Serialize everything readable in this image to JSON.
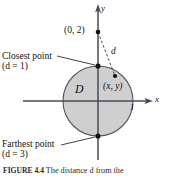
{
  "figure": {
    "caption_lead": "FIGURE 4.4",
    "caption_text": "The distance d from the",
    "background_color": "#ffffff"
  },
  "axes": {
    "x_label": "x",
    "y_label": "y",
    "axis_color": "#4a4a56",
    "origin_px": {
      "x": 98,
      "y": 101
    }
  },
  "disk": {
    "label": "D",
    "fill_color": "#cfcfcf",
    "stroke_color": "#555560",
    "center_px": {
      "x": 98,
      "y": 101
    },
    "radius_px": 35,
    "radius_label": "1"
  },
  "points": {
    "external": {
      "label": "(0, 2)",
      "px": {
        "x": 98,
        "y": 32
      }
    },
    "closest": {
      "title": "Closest point",
      "distance_label": "(d = 1)",
      "px": {
        "x": 98,
        "y": 66
      }
    },
    "farthest": {
      "title": "Farthest point",
      "distance_label": "(d = 3)",
      "px": {
        "x": 98,
        "y": 136
      }
    },
    "generic": {
      "label": "(x, y)",
      "px": {
        "x": 115,
        "y": 76
      }
    }
  },
  "segments": {
    "distance_label": "d"
  },
  "colors": {
    "ink": "#111111",
    "disk_fill": "#cfcfcf",
    "disk_stroke": "#555560",
    "axis": "#4a4a56",
    "leader": "#111111",
    "dashed": "#333340"
  }
}
